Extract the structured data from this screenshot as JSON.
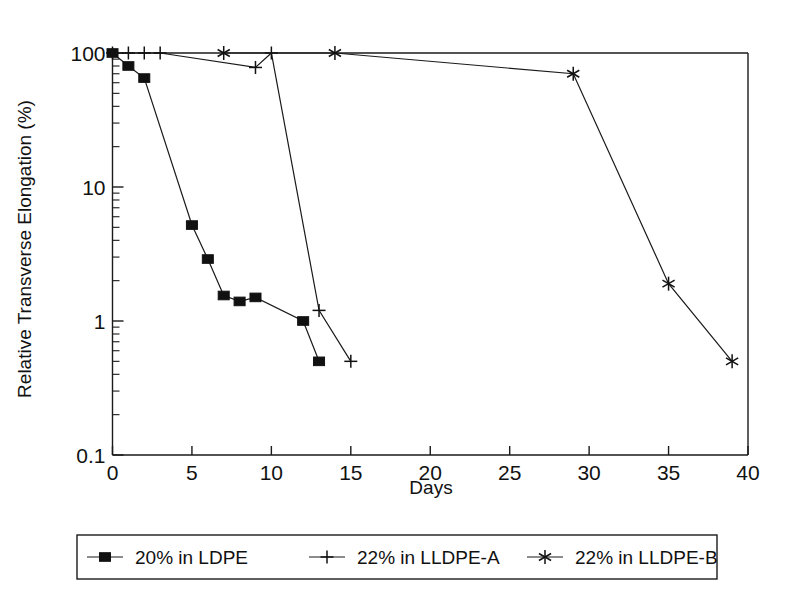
{
  "chart_data": {
    "type": "line",
    "title": "",
    "xlabel": "Days",
    "ylabel": "Relative Transverse Elongation (%)",
    "xlim": [
      0,
      40
    ],
    "ylim": [
      0.1,
      100
    ],
    "yscale": "log",
    "xscale": "linear",
    "grid": false,
    "legend_position": "below-plot",
    "x_ticks": [
      0,
      5,
      10,
      15,
      20,
      25,
      30,
      35,
      40
    ],
    "x_tick_labels": [
      "0",
      "5",
      "10",
      "15",
      "20",
      "25",
      "30",
      "35",
      "40"
    ],
    "y_ticks": [
      0.1,
      1,
      10,
      100
    ],
    "y_tick_labels": [
      "0.1",
      "1",
      "10",
      "100"
    ],
    "series": [
      {
        "name": "20% in LDPE",
        "marker": "filled-square",
        "points": [
          {
            "x": 0,
            "y": 100
          },
          {
            "x": 1,
            "y": 80
          },
          {
            "x": 2,
            "y": 65
          },
          {
            "x": 5,
            "y": 5.2
          },
          {
            "x": 6,
            "y": 2.9
          },
          {
            "x": 7,
            "y": 1.55
          },
          {
            "x": 8,
            "y": 1.4
          },
          {
            "x": 9,
            "y": 1.5
          },
          {
            "x": 12,
            "y": 1.0
          },
          {
            "x": 13,
            "y": 0.5
          }
        ]
      },
      {
        "name": "22% in LLDPE-A",
        "marker": "plus",
        "points": [
          {
            "x": 0,
            "y": 100
          },
          {
            "x": 1,
            "y": 100
          },
          {
            "x": 2,
            "y": 100
          },
          {
            "x": 3,
            "y": 100
          },
          {
            "x": 9,
            "y": 78
          },
          {
            "x": 10,
            "y": 100
          },
          {
            "x": 13,
            "y": 1.2
          },
          {
            "x": 15,
            "y": 0.5
          }
        ]
      },
      {
        "name": "22% in LLDPE-B",
        "marker": "asterisk",
        "points": [
          {
            "x": 7,
            "y": 100
          },
          {
            "x": 14,
            "y": 100
          },
          {
            "x": 29,
            "y": 70
          },
          {
            "x": 35,
            "y": 1.9
          },
          {
            "x": 39,
            "y": 0.5
          }
        ]
      }
    ]
  },
  "legend": {
    "entries": [
      {
        "label": "20% in LDPE",
        "marker": "filled-square"
      },
      {
        "label": "22% in LLDPE-A",
        "marker": "plus"
      },
      {
        "label": "22% in LLDPE-B",
        "marker": "asterisk"
      }
    ]
  },
  "colors": {
    "ink": "#111111",
    "background": "#ffffff"
  }
}
